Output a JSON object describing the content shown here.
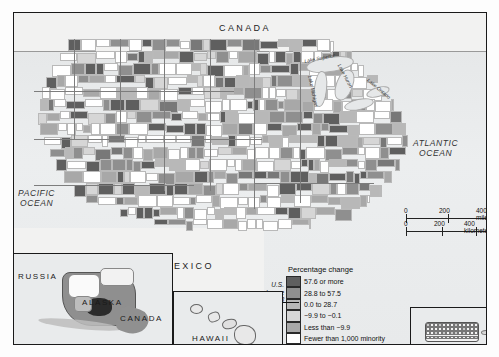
{
  "map": {
    "country_labels": [
      {
        "name": "CANADA",
        "text": "CANADA"
      },
      {
        "name": "MEXICO",
        "text": "MEXICO"
      }
    ],
    "ocean_labels": [
      {
        "text_line1": "PACIFIC",
        "text_line2": "OCEAN"
      },
      {
        "text_line1": "ATLANTIC",
        "text_line2": "OCEAN"
      }
    ],
    "lake_labels": [
      "Lake Superior",
      "Lake Michigan",
      "Lake Huron",
      "Lake Ontario"
    ]
  },
  "scale": {
    "miles": {
      "zero": "0",
      "mid": "200",
      "max": "400 miles"
    },
    "kilometers": {
      "zero": "0",
      "mid": "200",
      "max": "400 kilometers"
    }
  },
  "legend": {
    "title": "Percentage change",
    "us_change": {
      "line1": "U.S.",
      "line2": "change",
      "line3": "28.8"
    },
    "rows": [
      {
        "label": "57.6 or more",
        "color": "#5f5f5f",
        "class": "c5"
      },
      {
        "label": "28.8 to 57.5",
        "color": "#8f8f8f",
        "class": "c4"
      },
      {
        "label": "0.0 to 28.7",
        "color": "#b8b8b8",
        "class": "c3"
      },
      {
        "label": "−9.9 to −0.1",
        "color": "#d6d6d6",
        "class": "c2"
      },
      {
        "label": "Less than −9.9",
        "color": "#a8a8a8",
        "class": "c1"
      },
      {
        "label": "Fewer than 1,000 minority",
        "color": "#ffffff",
        "class": "c0"
      },
      {
        "label": "Not comparable",
        "color": "#787878",
        "class": "cn"
      }
    ]
  },
  "insets": {
    "alaska": {
      "labels": [
        "RUSSIA",
        "ALASKA",
        "CANADA"
      ]
    },
    "hawaii": {
      "labels": [
        "HAWAII"
      ]
    },
    "puerto_rico": {
      "labels": []
    }
  }
}
